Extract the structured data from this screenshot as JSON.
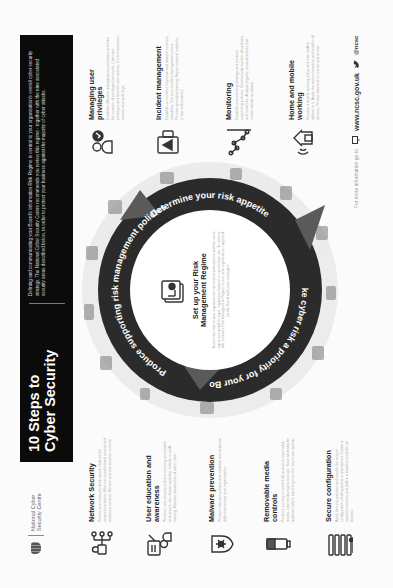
{
  "logo": {
    "org_line1": "National Cyber",
    "org_line2": "Security Centre"
  },
  "banner": {
    "title_line1": "10 Steps to",
    "title_line2": "Cyber Security",
    "intro": "Defining and communicating your Board's Information Risk Regime is central to your organisation's overall cyber security strategy. The National Cyber Security Centre recommends you review this regime - together with the nine associated security areas described below, in order to protect your business against the majority of cyber attacks."
  },
  "center": {
    "title_line1": "Set up your Risk",
    "title_line2": "Management Regime",
    "text": "Assess the risks to your organisation's information and systems with the same vigour you would for legal, regulatory, financial or operational risks. To achieve this, embed a Risk Management Regime across your organisation, supported by the Board and senior managers.",
    "icon": "document-icon"
  },
  "ring": {
    "segments": [
      "Produce supporting risk management policies",
      "Determine your risk appetite",
      "Make cyber risk a priority for your Board"
    ],
    "ring_color": "#2b2b2b",
    "arrow_color": "#5a5a5a"
  },
  "steps_left": [
    {
      "title": "Network Security",
      "text": "Protect your networks from attack. Defend the network perimeter, filter out unauthorised access and malicious content. Monitor and test security controls.",
      "icon": "network-lock-icon"
    },
    {
      "title": "User education and awareness",
      "text": "Produce user security policies covering acceptable and secure use of your systems. Include in staff training. Maintain awareness of cyber risks.",
      "icon": "user-training-icon"
    },
    {
      "title": "Malware prevention",
      "text": "Produce relevant policies and establish anti-malware defences across your organisation.",
      "icon": "shield-bug-icon"
    },
    {
      "title": "Removable media controls",
      "text": "Produce a policy to control all access to removable media. Limit media types and use. Scan all media for malware before importing onto the corporate system.",
      "icon": "usb-drive-icon"
    },
    {
      "title": "Secure configuration",
      "text": "Apply security patches and ensure the secure configuration of all systems is maintained. Create a system inventory and define a baseline build for all devices.",
      "icon": "server-config-icon"
    }
  ],
  "steps_right": [
    {
      "title": "Managing user privileges",
      "text": "Establish effective management processes and limit the number of privileged accounts. Limit user privileges and monitor user activity. Control access to activity and audit logs.",
      "icon": "user-privileges-icon"
    },
    {
      "title": "Incident management",
      "text": "Establish an incident response and disaster recovery capability. Test your incident management plans. Provide specialist training. Report criminal incidents to law enforcement.",
      "icon": "incident-warning-icon"
    },
    {
      "title": "Monitoring",
      "text": "Establish a monitoring strategy and produce supporting policies. Continuously monitor all systems and networks. Analyse logs for unusual activity that could indicate an attack.",
      "icon": "monitoring-graph-icon"
    },
    {
      "title": "Home and mobile working",
      "text": "Develop a mobile working policy and train staff to adhere to it. Apply the secure baseline and build to all devices. Protect data both in transit and at rest.",
      "icon": "home-wifi-icon"
    }
  ],
  "footer": {
    "lead": "For more information go to",
    "website": "www.ncsc.gov.uk",
    "twitter": "@ncsc"
  }
}
